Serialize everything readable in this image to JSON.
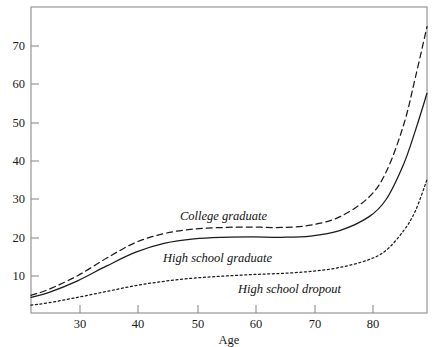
{
  "chart_data": {
    "type": "line",
    "title": "",
    "subtitle": "",
    "xlabel": "Age",
    "ylabel": "",
    "xlim": [
      22,
      90
    ],
    "ylim": [
      0,
      78
    ],
    "grid": false,
    "legend_position": "inline-annotations",
    "x_ticks": [
      30,
      40,
      50,
      60,
      70,
      80
    ],
    "x_tick_labels": [
      "30",
      "40",
      "50",
      "60",
      "70",
      "80"
    ],
    "y_ticks": [
      10,
      20,
      30,
      40,
      50,
      60,
      70
    ],
    "y_tick_labels": [
      "10",
      "20",
      "30",
      "40",
      "50",
      "60",
      "70"
    ],
    "x": [
      22,
      25,
      30,
      35,
      40,
      45,
      50,
      55,
      60,
      65,
      70,
      75,
      80,
      83,
      86,
      88,
      90
    ],
    "series": [
      {
        "name": "College graduate",
        "style": "dashed",
        "color": "#1a1a1a",
        "label_x": 50,
        "label_y": 26,
        "values": [
          4.5,
          6.0,
          9.5,
          14.0,
          18.0,
          20.3,
          21.4,
          21.8,
          21.9,
          21.8,
          22.4,
          24.5,
          29.5,
          36.0,
          48.0,
          60.0,
          73.0
        ]
      },
      {
        "name": "High school graduate",
        "style": "solid",
        "color": "#1a1a1a",
        "label_x": 53,
        "label_y": 17.5,
        "values": [
          4.0,
          5.2,
          8.2,
          12.0,
          15.5,
          17.8,
          18.9,
          19.3,
          19.4,
          19.3,
          19.6,
          21.0,
          24.5,
          29.0,
          38.0,
          46.5,
          56.0
        ]
      },
      {
        "name": "High school dropout",
        "style": "dotted",
        "color": "#1a1a1a",
        "label_x": 68,
        "label_y": 11.5,
        "values": [
          2.0,
          2.6,
          4.0,
          5.5,
          7.0,
          8.1,
          8.9,
          9.4,
          9.8,
          10.1,
          10.6,
          11.6,
          13.6,
          16.0,
          21.0,
          26.0,
          34.0
        ]
      }
    ]
  },
  "axes": {
    "x_axis_name": "Age",
    "plot_left_px": 31,
    "plot_right_px": 427,
    "plot_top_px": 7,
    "plot_bottom_px": 313
  }
}
